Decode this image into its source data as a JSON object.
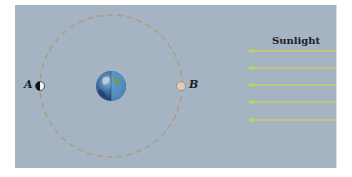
{
  "diagram": {
    "colors": {
      "background": "#a5b4c2",
      "orbit": "#b39a7c",
      "sun_ray": "#c8cf62",
      "text": "#1b1f27"
    },
    "labels": {
      "position_a": "A",
      "position_b": "B",
      "sunlight": "Sunlight"
    },
    "elements": {
      "earth": {
        "icon": "earth-globe-icon",
        "cx": 111,
        "cy": 86,
        "r": 15
      },
      "orbit": {
        "cx": 111,
        "cy": 86,
        "r": 71,
        "style": "dashed"
      },
      "moon_a": {
        "icon": "half-moon-icon",
        "cx": 40,
        "cy": 86,
        "phase": "half-lit-right"
      },
      "moon_b": {
        "icon": "full-moon-icon",
        "cx": 181,
        "cy": 86,
        "phase": "full"
      },
      "sun_rays": {
        "count": 5,
        "y": [
          51,
          68,
          85,
          102,
          120
        ],
        "x_from": 336,
        "x_to": 248,
        "direction": "left"
      }
    }
  }
}
